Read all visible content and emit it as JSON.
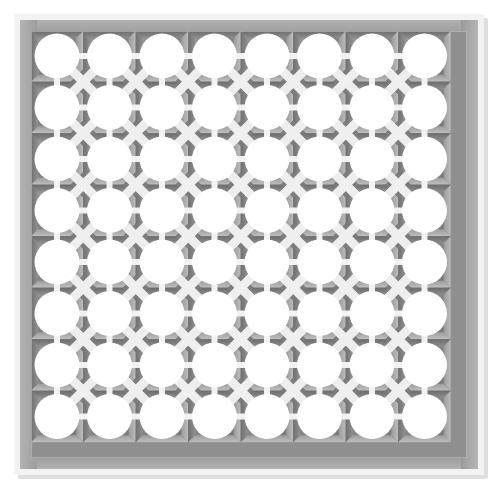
{
  "artwork": {
    "title": "Perforated Lattice Screen Panel",
    "subject": "decorative architectural breeze-block screen",
    "view": "orthographic front elevation",
    "canvas": {
      "width": 498,
      "height": 489,
      "background_color": "#ffffff"
    }
  },
  "frame": {
    "name": "outer-frame",
    "outer_rect": {
      "x": 14,
      "y": 14,
      "width": 470,
      "height": 461
    },
    "outer_highlight_color": "#f3f3f3",
    "outer_highlight_thickness": 11,
    "rail_color_top": "#a2a2a2",
    "rail_color_left": "#a8a8a8",
    "rail_color_right": "#9a9a9a",
    "rail_color_bottom": "#979797",
    "rail_thickness": 17,
    "inner_field_color": "#8f8f8f",
    "inner_rect": {
      "x": 31,
      "y": 31,
      "width": 436,
      "height": 427
    },
    "drop_shadow_color": "#dedede"
  },
  "grid": {
    "name": "circle-aperture-grid",
    "columns": 8,
    "rows": 8,
    "cell_pitch_x": 52.5,
    "cell_pitch_y": 51.5,
    "origin_x": 57,
    "origin_y": 56,
    "circle_radius": 22.5,
    "circle_color": "#ffffff",
    "total_apertures": 64
  },
  "web": {
    "name": "connecting-web",
    "orthogonal_bar_color": "#f2f2f2",
    "orthogonal_bar_width": 6,
    "diagonal_brace_color": "#eeeeee",
    "diagonal_brace_width": 9,
    "junction_node_color": "#f0f0f0",
    "junction_node_radius": 6
  },
  "shading": {
    "name": "recess-shading",
    "light_direction": "top-left",
    "deep_shadow_color": "#6e6e6e",
    "mid_shadow_color": "#838383",
    "light_face_color": "#b4b4b4",
    "highlight_color": "#c9c9c9",
    "diamond_fill_color": "#7c7c7c"
  },
  "palette": {
    "white": "#ffffff",
    "near_white": "#f3f3f3",
    "light_gray": "#c9c9c9",
    "mid_gray": "#a2a2a2",
    "field_gray": "#8f8f8f",
    "dark_gray": "#6e6e6e",
    "shadow_gray": "#dedede"
  }
}
